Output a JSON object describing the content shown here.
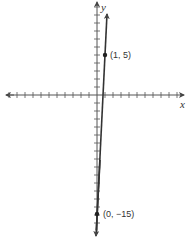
{
  "figure": {
    "type": "coordinate-plane-line-graph",
    "axes": {
      "x_label": "x",
      "y_label": "y"
    },
    "points": [
      {
        "label": "(1, 5)",
        "x": 1,
        "y": 5
      },
      {
        "label": "(0, −15)",
        "x": 0,
        "y": -15
      }
    ],
    "line": {
      "slope": 20,
      "intercept": -15,
      "equation": "y = 20x - 15"
    },
    "colors": {
      "axis": "#555555",
      "line": "#333333",
      "text": "#333333"
    }
  },
  "chart_data": {
    "type": "line",
    "title": "",
    "xlabel": "x",
    "ylabel": "y",
    "series": [
      {
        "name": "line",
        "x": [
          0,
          1
        ],
        "y": [
          -15,
          5
        ]
      }
    ],
    "annotations": [
      "(1, 5)",
      "(0, −15)"
    ],
    "xlim": [
      -12,
      11
    ],
    "ylim": [
      -17,
      11
    ],
    "grid": false,
    "tick_spacing": 1
  }
}
